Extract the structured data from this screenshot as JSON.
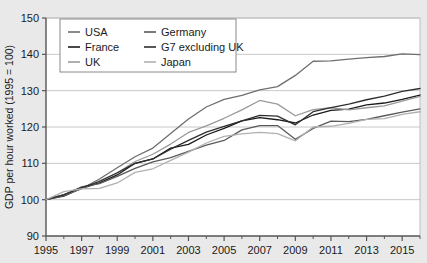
{
  "chart_data": {
    "type": "line",
    "title": "",
    "xlabel": "",
    "ylabel": "GDP per hour worked (1995 = 100)",
    "xlim": [
      1995,
      2016
    ],
    "ylim": [
      90,
      150
    ],
    "ytick_values": [
      90,
      100,
      110,
      120,
      130,
      140,
      150
    ],
    "ytick_labels": [
      "90",
      "100",
      "110",
      "120",
      "130",
      "140",
      "150"
    ],
    "xtick_values": [
      1995,
      1997,
      1999,
      2001,
      2003,
      2005,
      2007,
      2009,
      2011,
      2013,
      2015
    ],
    "xtick_labels": [
      "1995",
      "1997",
      "1999",
      "2001",
      "2003",
      "2005",
      "2007",
      "2009",
      "2011",
      "2013",
      "2015"
    ],
    "xtick_minor_values": [
      1996,
      1998,
      2000,
      2002,
      2004,
      2006,
      2008,
      2010,
      2012,
      2014,
      2016
    ],
    "grid": "horizontal",
    "legend_position": "top-left",
    "plot_background": "#ffffff",
    "figure_background": "#e9e9e9",
    "axis_color": "#555555",
    "grid_color": "#c8c8c8",
    "x": [
      1995,
      1996,
      1997,
      1998,
      1999,
      2000,
      2001,
      2002,
      2003,
      2004,
      2005,
      2006,
      2007,
      2008,
      2009,
      2010,
      2011,
      2012,
      2013,
      2014,
      2015,
      2016
    ],
    "series": [
      {
        "name": "USA",
        "color": "#6e6e6e",
        "values": [
          100.0,
          101.4,
          103.0,
          105.7,
          108.8,
          111.8,
          114.2,
          118.2,
          122.2,
          125.5,
          127.6,
          128.7,
          130.2,
          131.1,
          134.2,
          138.1,
          138.2,
          138.7,
          139.1,
          139.4,
          140.1,
          139.9
        ]
      },
      {
        "name": "France",
        "color": "#1a1a1a",
        "values": [
          100.0,
          101.0,
          103.1,
          104.6,
          106.8,
          110.0,
          111.2,
          114.2,
          115.2,
          117.8,
          119.6,
          121.7,
          122.6,
          122.0,
          121.1,
          123.3,
          124.6,
          124.9,
          126.1,
          126.6,
          127.6,
          128.8
        ]
      },
      {
        "name": "UK",
        "color": "#9a9a9a",
        "values": [
          100.0,
          101.2,
          103.1,
          105.2,
          107.3,
          110.5,
          112.5,
          115.3,
          118.5,
          120.3,
          122.4,
          124.7,
          127.3,
          126.3,
          123.1,
          124.8,
          125.3,
          124.7,
          125.3,
          125.8,
          127.1,
          128.4
        ]
      },
      {
        "name": "Germany",
        "color": "#5a5a5a",
        "values": [
          100.0,
          101.3,
          103.5,
          104.4,
          106.4,
          108.6,
          110.4,
          111.6,
          113.3,
          115.0,
          116.3,
          119.2,
          120.4,
          120.4,
          116.6,
          119.6,
          121.6,
          121.5,
          122.1,
          123.1,
          124.1,
          125.0
        ]
      },
      {
        "name": "G7 excluding UK",
        "color": "#2e2e2e",
        "values": [
          100.0,
          101.3,
          103.3,
          105.0,
          107.4,
          110.0,
          111.2,
          113.9,
          116.3,
          118.6,
          120.2,
          121.7,
          123.2,
          123.0,
          120.6,
          124.2,
          125.3,
          126.3,
          127.5,
          128.5,
          129.8,
          130.6
        ]
      },
      {
        "name": "Japan",
        "color": "#b0b0b0",
        "values": [
          100.0,
          102.2,
          103.0,
          103.1,
          104.6,
          107.5,
          108.5,
          110.8,
          113.1,
          115.6,
          117.4,
          118.1,
          118.5,
          118.2,
          116.2,
          120.0,
          120.2,
          121.0,
          122.1,
          122.3,
          123.5,
          124.2
        ]
      }
    ],
    "legend": [
      {
        "label": "USA",
        "color": "#6e6e6e"
      },
      {
        "label": "Germany",
        "color": "#5a5a5a"
      },
      {
        "label": "France",
        "color": "#1a1a1a"
      },
      {
        "label": "G7 excluding UK",
        "color": "#2e2e2e"
      },
      {
        "label": "UK",
        "color": "#9a9a9a"
      },
      {
        "label": "Japan",
        "color": "#b0b0b0"
      }
    ]
  }
}
